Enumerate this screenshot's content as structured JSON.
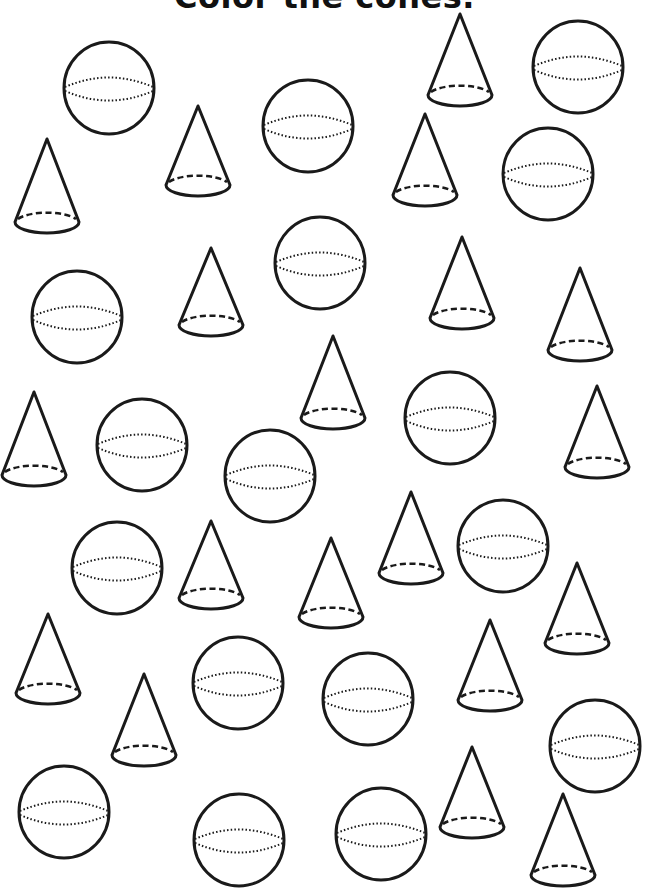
{
  "worksheet": {
    "title": "Color the cones.",
    "colors": {
      "ink": "#1a1a1a",
      "paper": "#ffffff"
    },
    "counts": {
      "cones": 19,
      "spheres": 17
    },
    "spheres": [
      {
        "cx": 109,
        "cy": 88
      },
      {
        "cx": 578,
        "cy": 67
      },
      {
        "cx": 308,
        "cy": 126
      },
      {
        "cx": 548,
        "cy": 174
      },
      {
        "cx": 320,
        "cy": 263
      },
      {
        "cx": 77,
        "cy": 317
      },
      {
        "cx": 142,
        "cy": 445
      },
      {
        "cx": 450,
        "cy": 418
      },
      {
        "cx": 270,
        "cy": 476
      },
      {
        "cx": 117,
        "cy": 568
      },
      {
        "cx": 503,
        "cy": 546
      },
      {
        "cx": 238,
        "cy": 683
      },
      {
        "cx": 368,
        "cy": 699
      },
      {
        "cx": 595,
        "cy": 746
      },
      {
        "cx": 64,
        "cy": 812
      },
      {
        "cx": 239,
        "cy": 840
      },
      {
        "cx": 381,
        "cy": 834
      }
    ],
    "cones": [
      {
        "x": 460,
        "top": 14,
        "base": 95
      },
      {
        "x": 198,
        "top": 106,
        "base": 185
      },
      {
        "x": 425,
        "top": 114,
        "base": 195
      },
      {
        "x": 47,
        "top": 139,
        "base": 222
      },
      {
        "x": 211,
        "top": 248,
        "base": 325
      },
      {
        "x": 462,
        "top": 237,
        "base": 318
      },
      {
        "x": 580,
        "top": 268,
        "base": 350
      },
      {
        "x": 333,
        "top": 336,
        "base": 418
      },
      {
        "x": 34,
        "top": 392,
        "base": 475
      },
      {
        "x": 597,
        "top": 386,
        "base": 467
      },
      {
        "x": 411,
        "top": 492,
        "base": 573
      },
      {
        "x": 211,
        "top": 521,
        "base": 598
      },
      {
        "x": 331,
        "top": 538,
        "base": 617
      },
      {
        "x": 577,
        "top": 563,
        "base": 643
      },
      {
        "x": 48,
        "top": 614,
        "base": 693
      },
      {
        "x": 490,
        "top": 620,
        "base": 700
      },
      {
        "x": 144,
        "top": 674,
        "base": 755
      },
      {
        "x": 472,
        "top": 747,
        "base": 827
      },
      {
        "x": 563,
        "top": 794,
        "base": 875
      }
    ],
    "sphere_size": {
      "rx": 45,
      "ry": 46
    },
    "cone_size": {
      "half_width": 32,
      "base_ry": 11
    }
  }
}
